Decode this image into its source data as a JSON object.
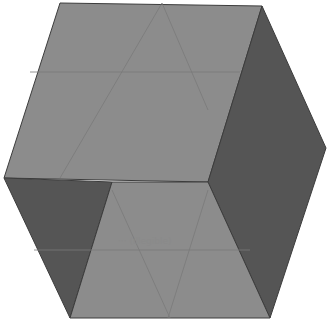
{
  "figure": {
    "type": "shaded-polyhedron",
    "colors": {
      "light_face": "#8c8c8c",
      "dark_face": "#555555",
      "edge": "#3c3c3c",
      "guide_line": "#7a7a7a",
      "background": "#ffffff"
    },
    "faces": [
      {
        "name": "top-light-face",
        "shade": "light",
        "points": "60,3 262,6 208,182 4,178"
      },
      {
        "name": "right-dark-face",
        "shade": "dark",
        "points": "262,6 326,148 270,318 208,182"
      },
      {
        "name": "left-dark-face",
        "shade": "dark",
        "points": "4,178 112,182 70,318"
      },
      {
        "name": "bottom-light-face",
        "shade": "light",
        "points": "112,182 208,182 270,318 70,318"
      }
    ],
    "guide_lines": [
      {
        "x1": 162,
        "y1": 3,
        "x2": 60,
        "y2": 178
      },
      {
        "x1": 162,
        "y1": 3,
        "x2": 208,
        "y2": 110
      },
      {
        "x1": 30,
        "y1": 72,
        "x2": 240,
        "y2": 72
      },
      {
        "x1": 34,
        "y1": 250,
        "x2": 250,
        "y2": 250
      },
      {
        "x1": 112,
        "y1": 190,
        "x2": 170,
        "y2": 318
      },
      {
        "x1": 208,
        "y1": 190,
        "x2": 168,
        "y2": 318
      }
    ],
    "label": "··· (illegible)"
  }
}
